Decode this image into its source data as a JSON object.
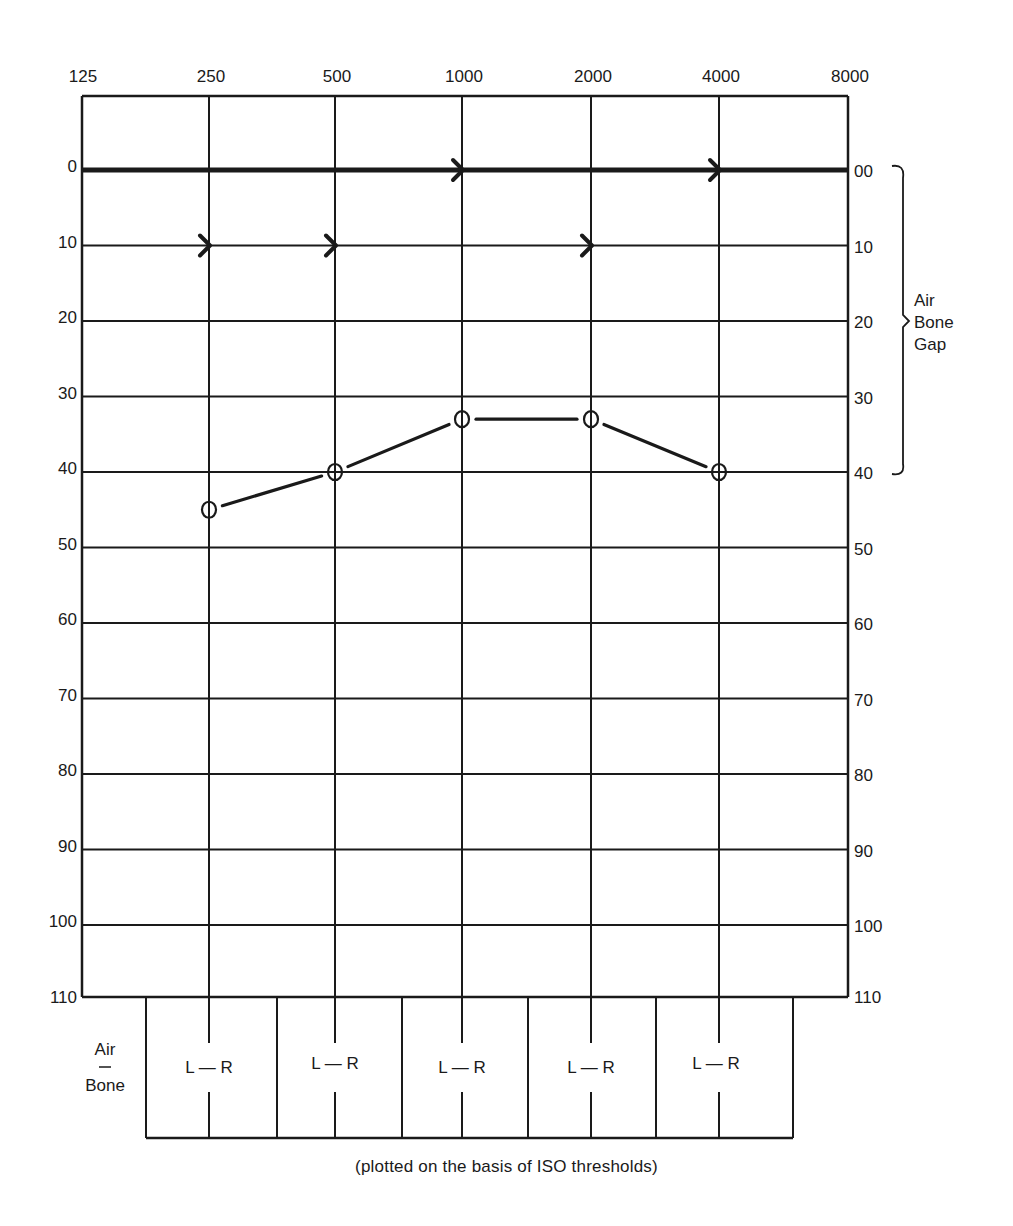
{
  "chart_data": {
    "type": "line",
    "xlabel": "Frequency (Hz)",
    "ylabel": "Hearing level (dB)",
    "x": [
      125,
      250,
      500,
      1000,
      2000,
      4000,
      8000
    ],
    "x_tick_labels": [
      "125",
      "250",
      "500",
      "1000",
      "2000",
      "4000",
      "8000"
    ],
    "y_tick_labels_left": [
      "0",
      "10",
      "20",
      "30",
      "40",
      "50",
      "60",
      "70",
      "80",
      "90",
      "100",
      "110"
    ],
    "y_tick_labels_right": [
      "00",
      "10",
      "20",
      "30",
      "40",
      "50",
      "60",
      "70",
      "80",
      "90",
      "100",
      "110"
    ],
    "ylim": [
      -10,
      110
    ],
    "y_inverted": true,
    "grid": true,
    "series": [
      {
        "name": "Air conduction (O)",
        "marker": "circle",
        "x": [
          250,
          500,
          1000,
          2000,
          4000
        ],
        "values": [
          45,
          40,
          33,
          33,
          40
        ]
      },
      {
        "name": "Bone conduction (>)",
        "marker": "right-bracket",
        "x": [
          250,
          500,
          1000,
          2000,
          4000
        ],
        "values": [
          10,
          10,
          0,
          10,
          0
        ]
      }
    ],
    "annotations": [
      {
        "text": "Air Bone Gap",
        "type": "bracket",
        "from_db": 0,
        "to_db": 40,
        "side": "right"
      }
    ]
  },
  "side_label": {
    "line1": "Air",
    "line2": "Bone",
    "line3": "Gap"
  },
  "table": {
    "row_label_top": "Air",
    "row_label_bottom": "Bone",
    "cells": [
      "L — R",
      "L — R",
      "L — R",
      "L — R",
      "L — R"
    ]
  },
  "caption": "(plotted on the basis of ISO thresholds)"
}
